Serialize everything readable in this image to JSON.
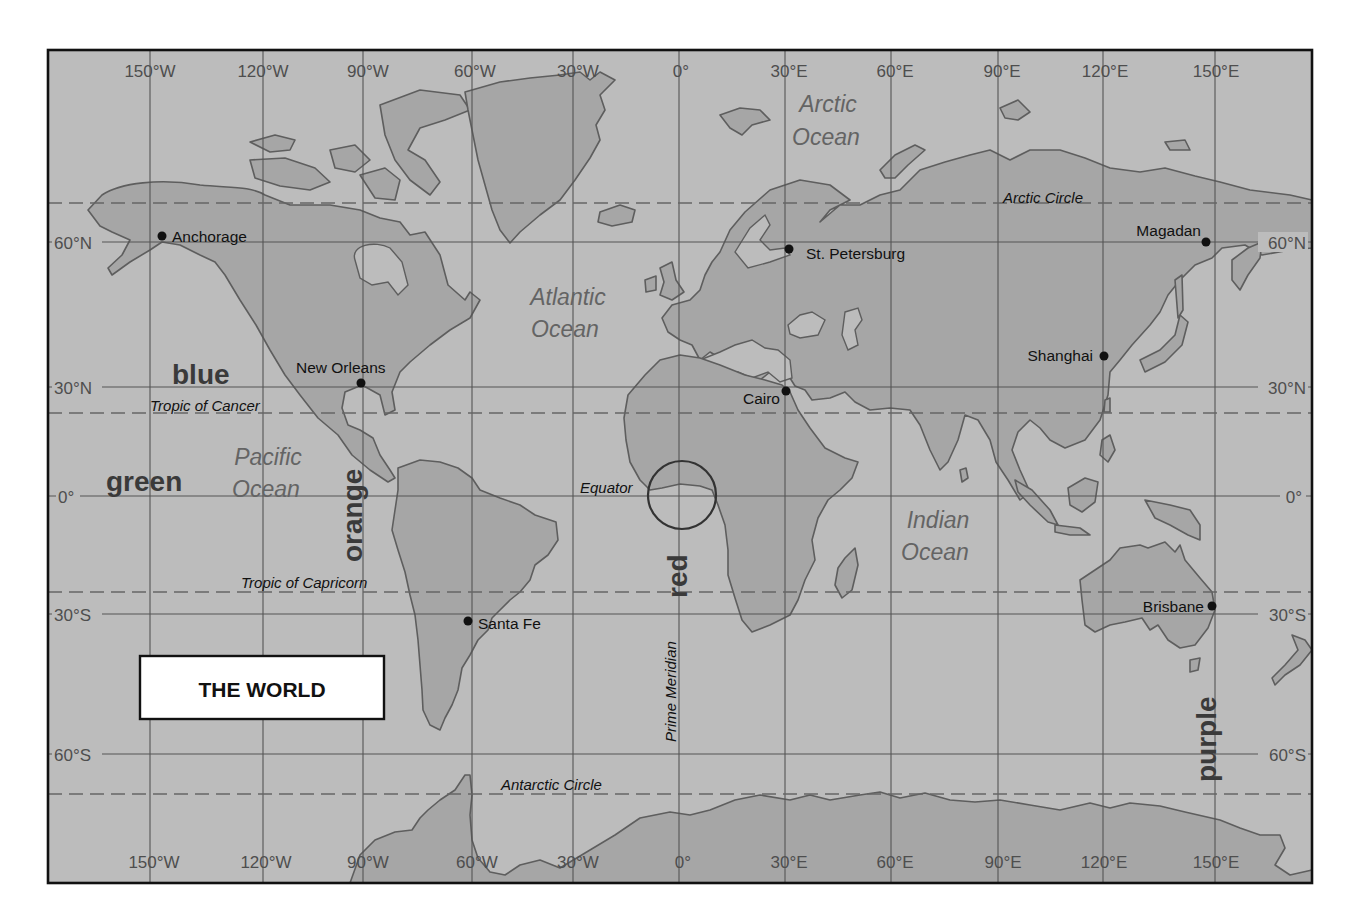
{
  "map": {
    "title": "THE WORLD",
    "colors": {
      "ocean": "#bcbcbc",
      "land": "#a6a6a6",
      "coastline": "#5e5e5e",
      "frame": "#111111"
    },
    "longitude_labels_top": [
      "150°W",
      "120°W",
      "90°W",
      "60°W",
      "30°W",
      "0°",
      "30°E",
      "60°E",
      "90°E",
      "120°E",
      "150°E"
    ],
    "longitude_labels_bottom": [
      "150°W",
      "120°W",
      "90°W",
      "60°W",
      "30°W",
      "0°",
      "30°E",
      "60°E",
      "90°E",
      "120°E",
      "150°E"
    ],
    "latitude_labels_left": [
      "60°N",
      "30°N",
      "0°",
      "30°S",
      "60°S"
    ],
    "latitude_labels_right": [
      "60°N",
      "30°N",
      "0°",
      "30°S",
      "60°S"
    ],
    "special_lines": {
      "arctic_circle": "Arctic Circle",
      "tropic_of_cancer": "Tropic of Cancer",
      "equator": "Equator",
      "tropic_of_capricorn": "Tropic of Capricorn",
      "antarctic_circle": "Antarctic Circle",
      "prime_meridian": "Prime Meridian"
    },
    "oceans": {
      "arctic": [
        "Arctic",
        "Ocean"
      ],
      "atlantic": [
        "Atlantic",
        "Ocean"
      ],
      "pacific": [
        "Pacific",
        "Ocean"
      ],
      "indian": [
        "Indian",
        "Ocean"
      ]
    },
    "cities": [
      {
        "name": "Anchorage"
      },
      {
        "name": "St. Petersburg"
      },
      {
        "name": "Magadan"
      },
      {
        "name": "New Orleans"
      },
      {
        "name": "Shanghai"
      },
      {
        "name": "Cairo"
      },
      {
        "name": "Santa Fe"
      },
      {
        "name": "Brisbane"
      }
    ],
    "color_labels": {
      "blue": "blue",
      "green": "green",
      "orange": "orange",
      "red": "red",
      "purple": "purple"
    }
  }
}
